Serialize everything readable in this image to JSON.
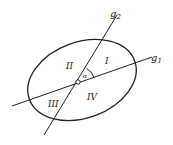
{
  "diagram": {
    "lines": [
      {
        "name": "g1",
        "label": "g",
        "subscript": "1"
      },
      {
        "name": "g2",
        "label": "g",
        "subscript": "2"
      }
    ],
    "regions": [
      "I",
      "II",
      "III",
      "IV"
    ],
    "angle_label": "α",
    "colors": {
      "stroke": "#222222",
      "background": "#ffffff"
    }
  }
}
